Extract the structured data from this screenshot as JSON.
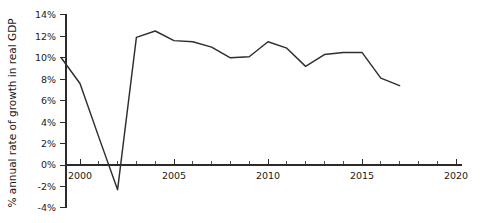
{
  "chart_data": {
    "type": "line",
    "title": "",
    "subtitle": "",
    "xlabel": "",
    "ylabel": "% annual rate of growth in real GDP",
    "xlim": [
      1998.6,
      2020.9
    ],
    "ylim": [
      -4,
      14
    ],
    "grid": false,
    "legend": false,
    "legend_position": "none",
    "x_tick_labels": [
      "2000",
      "2005",
      "2010",
      "2015",
      "2020"
    ],
    "x_tick_values": [
      2000,
      2005,
      2010,
      2015,
      2020
    ],
    "x_minor_tick_interval": 1,
    "y_tick_labels": [
      "14%",
      "12%",
      "10%",
      "8%",
      "6%",
      "4%",
      "2%",
      "0%",
      "-2%",
      "-4%"
    ],
    "y_tick_values": [
      14,
      12,
      10,
      8,
      6,
      4,
      2,
      0,
      -2,
      -4
    ],
    "baseline_value": 0,
    "series": [
      {
        "name": "annual real GDP growth",
        "color": "#2e2e2e",
        "x": [
          1999,
          2000,
          2001,
          2002,
          2003,
          2004,
          2005,
          2006,
          2007,
          2008,
          2009,
          2010,
          2011,
          2012,
          2013,
          2014,
          2015,
          2016,
          2017
        ],
        "values": [
          10.0,
          7.6,
          2.6,
          -2.3,
          11.9,
          12.5,
          11.6,
          11.5,
          11.0,
          10.0,
          10.1,
          11.5,
          10.9,
          9.2,
          10.3,
          10.5,
          10.5,
          8.1,
          7.4
        ]
      }
    ]
  },
  "axes": {
    "y_axis_name": "percent-axis",
    "x_axis_name": "year-axis"
  }
}
